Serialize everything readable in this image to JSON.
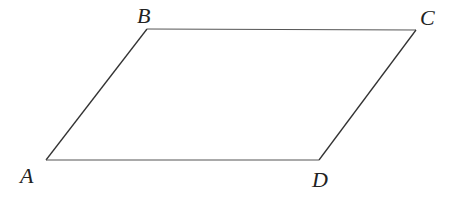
{
  "diagram": {
    "type": "parallelogram",
    "stroke_color": "#333333",
    "vertices": [
      {
        "id": "A",
        "label": "A",
        "x": 46,
        "y": 160,
        "label_x": 20,
        "label_y": 183
      },
      {
        "id": "B",
        "label": "B",
        "x": 147,
        "y": 29,
        "label_x": 137,
        "label_y": 23
      },
      {
        "id": "C",
        "label": "C",
        "x": 416,
        "y": 30,
        "label_x": 420,
        "label_y": 25
      },
      {
        "id": "D",
        "label": "D",
        "x": 319,
        "y": 160,
        "label_x": 312,
        "label_y": 187
      }
    ],
    "edges": [
      [
        "A",
        "B"
      ],
      [
        "B",
        "C"
      ],
      [
        "C",
        "D"
      ],
      [
        "D",
        "A"
      ]
    ]
  }
}
